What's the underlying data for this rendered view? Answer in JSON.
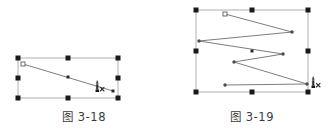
{
  "page": {
    "background_color": "#ffffff",
    "width": 336,
    "height": 136
  },
  "figures": [
    {
      "id": "figure-left",
      "caption": "图 3-18",
      "selection": {
        "box": {
          "x": 18,
          "y": 58,
          "width": 100,
          "height": 40
        },
        "stroke_color": "#9a9a9a",
        "handle_color": "#1a1a1a",
        "handle_size": 5,
        "handles": [
          {
            "name": "handle-top-left",
            "x": 18,
            "y": 58
          },
          {
            "name": "handle-top-center",
            "x": 68,
            "y": 58
          },
          {
            "name": "handle-top-right",
            "x": 118,
            "y": 58
          },
          {
            "name": "handle-middle-left",
            "x": 18,
            "y": 78
          },
          {
            "name": "handle-middle-right",
            "x": 118,
            "y": 78
          },
          {
            "name": "handle-bottom-left",
            "x": 18,
            "y": 98
          },
          {
            "name": "handle-bottom-center",
            "x": 68,
            "y": 98
          },
          {
            "name": "handle-bottom-right",
            "x": 118,
            "y": 98
          }
        ]
      },
      "path": {
        "stroke_color": "#6e6e6e",
        "points": [
          {
            "x": 23,
            "y": 64
          },
          {
            "x": 113,
            "y": 91
          }
        ],
        "start_node": {
          "x": 23,
          "y": 64,
          "type": "hollow-square",
          "size": 4
        },
        "mid_node": {
          "x": 68,
          "y": 77,
          "type": "filled-square",
          "size": 3
        },
        "end_node": {
          "x": 113,
          "y": 91,
          "type": "filled-square",
          "size": 3
        }
      },
      "cursor": {
        "x": 96,
        "y": 84,
        "label": "x",
        "icon": "paint-bucket-cursor-icon"
      }
    },
    {
      "id": "figure-right",
      "caption": "图 3-19",
      "selection": {
        "box": {
          "x": 28,
          "y": 10,
          "width": 112,
          "height": 82
        },
        "stroke_color": "#9a9a9a",
        "handle_color": "#1a1a1a",
        "handle_size": 5,
        "handles": [
          {
            "name": "handle-top-left",
            "x": 28,
            "y": 10
          },
          {
            "name": "handle-top-center",
            "x": 84,
            "y": 10
          },
          {
            "name": "handle-top-right",
            "x": 140,
            "y": 10
          },
          {
            "name": "handle-middle-left",
            "x": 28,
            "y": 51
          },
          {
            "name": "handle-middle-right",
            "x": 140,
            "y": 51
          },
          {
            "name": "handle-bottom-left",
            "x": 28,
            "y": 92
          },
          {
            "name": "handle-bottom-center",
            "x": 84,
            "y": 92
          },
          {
            "name": "handle-bottom-right",
            "x": 140,
            "y": 92
          }
        ]
      },
      "path": {
        "stroke_color": "#6e6e6e",
        "points": [
          {
            "x": 57,
            "y": 14
          },
          {
            "x": 124,
            "y": 32
          },
          {
            "x": 31,
            "y": 41
          },
          {
            "x": 115,
            "y": 54
          },
          {
            "x": 66,
            "y": 62
          },
          {
            "x": 139,
            "y": 84
          },
          {
            "x": 57,
            "y": 85
          }
        ],
        "start_node": {
          "x": 57,
          "y": 14,
          "type": "hollow-square",
          "size": 4
        },
        "mid_node": {
          "x": 84,
          "y": 51,
          "type": "filled-square",
          "size": 3
        },
        "vertex_node_type": "filled-dot",
        "vertex_node_size": 2
      },
      "cursor": {
        "x": 144,
        "y": 80,
        "label": "x",
        "icon": "paint-bucket-cursor-icon"
      }
    }
  ]
}
